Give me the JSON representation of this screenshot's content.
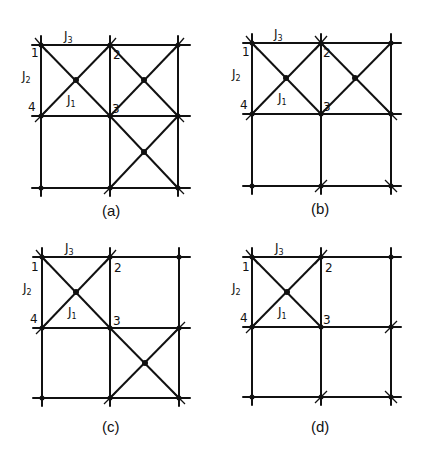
{
  "figure": {
    "panels": [
      {
        "id": "a",
        "caption": "(a)",
        "origin": [
          41,
          45
        ],
        "cell": [
          69,
          71
        ],
        "crossed_cells": [
          [
            0,
            0
          ],
          [
            1,
            0
          ],
          [
            1,
            1
          ]
        ],
        "labels": {
          "J3": "J",
          "J3_sub": "3",
          "J2": "J",
          "J2_sub": "2",
          "J1": "J",
          "J1_sub": "1",
          "n1": "1",
          "n2": "2",
          "n3": "3",
          "n4": "4"
        }
      },
      {
        "id": "b",
        "caption": "(b)",
        "origin": [
          252,
          43
        ],
        "cell": [
          69,
          71
        ],
        "crossed_cells": [
          [
            0,
            0
          ],
          [
            1,
            0
          ]
        ],
        "labels": {
          "J3": "J",
          "J3_sub": "3",
          "J2": "J",
          "J2_sub": "2",
          "J1": "J",
          "J1_sub": "1",
          "n1": "1",
          "n2": "2",
          "n3": "3",
          "n4": "4"
        }
      },
      {
        "id": "c",
        "caption": "(c)",
        "origin": [
          42,
          257
        ],
        "cell": [
          68,
          71
        ],
        "crossed_cells": [
          [
            0,
            0
          ],
          [
            1,
            1
          ]
        ],
        "labels": {
          "J3": "J",
          "J3_sub": "3",
          "J2": "J",
          "J2_sub": "2",
          "J1": "J",
          "J1_sub": "1",
          "n1": "1",
          "n2": "2",
          "n3": "3",
          "n4": "4"
        }
      },
      {
        "id": "d",
        "caption": "(d)",
        "origin": [
          252,
          257
        ],
        "cell": [
          69,
          70
        ],
        "crossed_cells": [
          [
            0,
            0
          ]
        ],
        "labels": {
          "J3": "J",
          "J3_sub": "3",
          "J2": "J",
          "J2_sub": "2",
          "J1": "J",
          "J1_sub": "1",
          "n1": "1",
          "n2": "2",
          "n3": "3",
          "n4": "4"
        }
      }
    ]
  }
}
